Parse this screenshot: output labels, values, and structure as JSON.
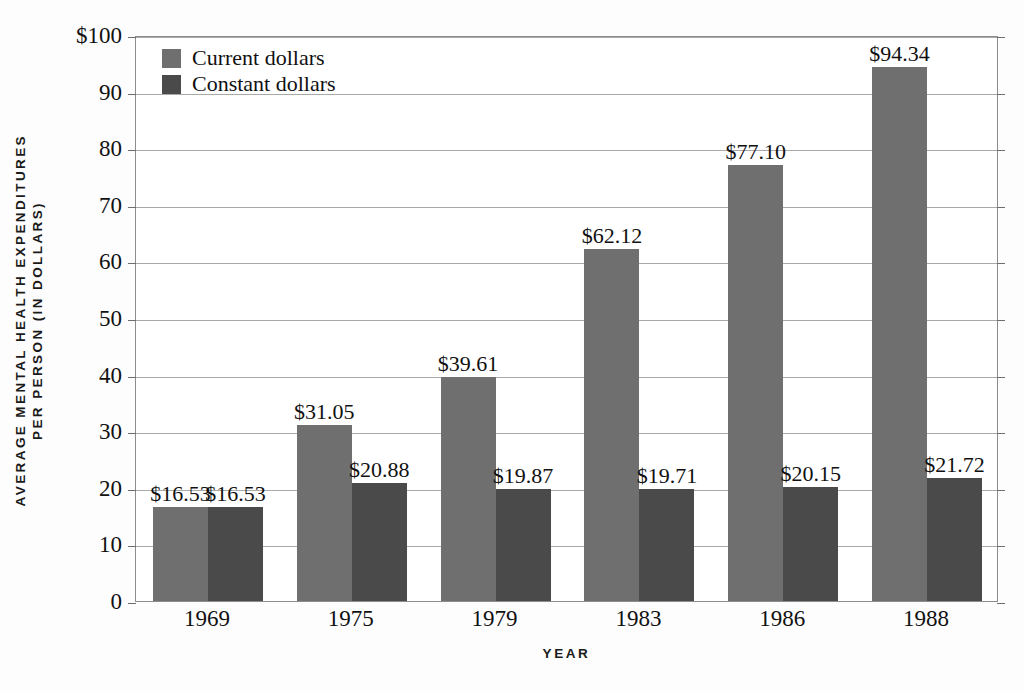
{
  "chart_data": {
    "type": "bar",
    "title": "",
    "xlabel": "YEAR",
    "ylabel_lines": [
      "AVERAGE MENTAL HEALTH EXPENDITURES",
      "PER PERSON (IN DOLLARS)"
    ],
    "ylabel": "AVERAGE MENTAL HEALTH EXPENDITURES PER PERSON (IN DOLLARS)",
    "categories": [
      "1969",
      "1975",
      "1979",
      "1983",
      "1986",
      "1988"
    ],
    "series": [
      {
        "name": "Current dollars",
        "color": "#6f6f6f",
        "values": [
          16.53,
          31.05,
          39.61,
          62.12,
          77.1,
          94.34
        ],
        "labels": [
          "$16.53",
          "$31.05",
          "$39.61",
          "$62.12",
          "$77.10",
          "$94.34"
        ]
      },
      {
        "name": "Constant dollars",
        "color": "#4a4a4a",
        "values": [
          16.53,
          20.88,
          19.87,
          19.71,
          20.15,
          21.72
        ],
        "labels": [
          "$16.53",
          "$20.88",
          "$19.87",
          "$19.71",
          "$20.15",
          "$21.72"
        ]
      }
    ],
    "ylim": [
      0,
      100
    ],
    "yticks": [
      0,
      10,
      20,
      30,
      40,
      50,
      60,
      70,
      80,
      90,
      100
    ],
    "ytick_labels": [
      "0",
      "10",
      "20",
      "30",
      "40",
      "50",
      "60",
      "70",
      "80",
      "90",
      "$100"
    ],
    "grid": true,
    "legend_position": "top-left",
    "legend": [
      {
        "label": "Current dollars",
        "color": "#6f6f6f"
      },
      {
        "label": "Constant dollars",
        "color": "#4a4a4a"
      }
    ]
  }
}
